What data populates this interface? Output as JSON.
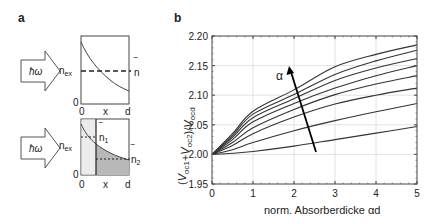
{
  "panels": {
    "a": {
      "letter": "a",
      "top": {
        "photon_label": "ħω",
        "y_label_main": "n",
        "y_label_sub": "ex",
        "y_zero": "0",
        "x_ticks": [
          "0",
          "x",
          "d"
        ],
        "avg_label": "n",
        "avg_bar": "‾"
      },
      "bottom": {
        "photon_label": "ħω",
        "y_label_main": "n",
        "y_label_sub": "ex",
        "y_zero": "0",
        "x_ticks": [
          "0",
          "x",
          "d"
        ],
        "avg1_label": "n",
        "avg1_sub": "1",
        "avg2_label": "n",
        "avg2_sub": "2",
        "avg_bar": "‾"
      }
    },
    "b": {
      "letter": "b",
      "arrow_label": "α"
    }
  },
  "colors": {
    "line": "#333333",
    "grid": "#e2e2e2",
    "shade_light": "#ececec",
    "shade_dark": "#b8b8b8",
    "arrow": "#000000"
  },
  "chart_data": [
    {
      "type": "diagram",
      "title": "a (top): single absorber – exponentially decaying excitation density n_ex(x) with average n̄",
      "xlabel": "x",
      "x_ticks": [
        "0",
        "x",
        "d"
      ],
      "ylabel": "n_ex",
      "annotations": [
        "ħω",
        "n̄ (dashed average line)"
      ]
    },
    {
      "type": "diagram",
      "title": "a (bottom): split absorber – n_ex(x) with averages n̄1 (left segment) and n̄2 (right segment)",
      "xlabel": "x",
      "x_ticks": [
        "0",
        "x",
        "d"
      ],
      "ylabel": "n_ex",
      "annotations": [
        "ħω",
        "n̄1",
        "n̄2"
      ]
    },
    {
      "type": "line",
      "title": "b",
      "xlabel": "norm. Absorberdicke αd",
      "ylabel": "(V_oc1+V_oc2)/V_ocd",
      "xlim": [
        0,
        5
      ],
      "ylim": [
        1.95,
        2.2
      ],
      "x_ticks": [
        "0",
        "1",
        "2",
        "3",
        "4",
        "5"
      ],
      "y_ticks": [
        "1.95",
        "2.00",
        "2.05",
        "2.10",
        "2.15",
        "2.20"
      ],
      "grid": true,
      "annotation": "arrow labeled α pointing toward higher curves (increasing α)",
      "x": [
        0,
        0.5,
        1,
        2,
        3,
        4,
        5
      ],
      "series": [
        {
          "name": "curve 1 (lowest α)",
          "values": [
            2.0,
            2.002,
            2.005,
            2.014,
            2.025,
            2.036,
            2.047
          ]
        },
        {
          "name": "curve 2",
          "values": [
            2.0,
            2.008,
            2.02,
            2.04,
            2.057,
            2.072,
            2.086
          ]
        },
        {
          "name": "curve 3",
          "values": [
            2.0,
            2.015,
            2.035,
            2.063,
            2.085,
            2.1,
            2.112
          ]
        },
        {
          "name": "curve 4",
          "values": [
            2.0,
            2.02,
            2.045,
            2.076,
            2.101,
            2.119,
            2.133
          ]
        },
        {
          "name": "curve 5",
          "values": [
            2.0,
            2.025,
            2.055,
            2.086,
            2.112,
            2.133,
            2.15
          ]
        },
        {
          "name": "curve 6",
          "values": [
            2.0,
            2.029,
            2.062,
            2.094,
            2.125,
            2.146,
            2.162
          ]
        },
        {
          "name": "curve 7",
          "values": [
            2.0,
            2.032,
            2.068,
            2.101,
            2.135,
            2.158,
            2.176
          ]
        },
        {
          "name": "curve 8 (highest α)",
          "values": [
            2.0,
            2.035,
            2.073,
            2.109,
            2.148,
            2.169,
            2.185
          ]
        }
      ]
    }
  ]
}
